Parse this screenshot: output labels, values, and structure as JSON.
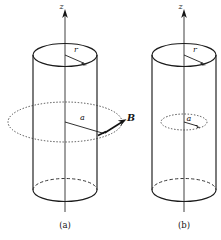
{
  "figure": {
    "background_color": "#ffffff",
    "ink_color": "#1a1a1a"
  },
  "panels": [
    {
      "id": "panel-a",
      "caption": "(a)",
      "axis_label": "z",
      "cylinder_radius_label": "r",
      "field_radius_label": "a",
      "vector_label": "B",
      "loop_style": "dotted",
      "loop_outside_cylinder": true,
      "geometry": {
        "cx": 65,
        "left": 33,
        "right": 97,
        "top_ellipse_cy": 55,
        "bottom_ellipse_cy": 190,
        "ellipse_rx": 32,
        "ellipse_ry": 11.5,
        "loop_cy": 122,
        "loop_rx": 57,
        "loop_ry": 20,
        "axis_top": 10,
        "axis_bottom": 212
      }
    },
    {
      "id": "panel-b",
      "caption": "(b)",
      "axis_label": "z",
      "cylinder_radius_label": "r",
      "field_radius_label": "a",
      "vector_label": "",
      "loop_style": "dotted",
      "loop_outside_cylinder": false,
      "geometry": {
        "cx": 184,
        "left": 152,
        "right": 216,
        "top_ellipse_cy": 55,
        "bottom_ellipse_cy": 190,
        "ellipse_rx": 32,
        "ellipse_ry": 11.5,
        "loop_cy": 122,
        "loop_rx": 23,
        "loop_ry": 8,
        "axis_top": 10,
        "axis_bottom": 212
      }
    }
  ],
  "colors": {
    "stroke": "#1b1b1b",
    "dotted": "#3a3a3a",
    "dashed": "#2a2a2a",
    "vector": "#121212"
  }
}
